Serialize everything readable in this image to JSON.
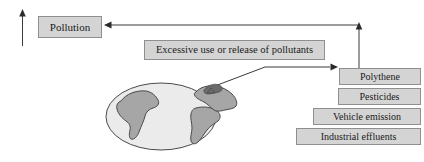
{
  "diagram": {
    "nodes": {
      "pollution": {
        "label": "Pollution"
      },
      "excessive": {
        "label": "Excessive use or release of pollutants"
      },
      "sources": [
        {
          "label": "Polythene"
        },
        {
          "label": "Pesticides"
        },
        {
          "label": "Vehicle emission"
        },
        {
          "label": "Industrial effluents"
        }
      ]
    },
    "illustration": {
      "name": "earth-globe"
    },
    "connectors": [
      {
        "name": "up-arrow-left",
        "direction": "up"
      },
      {
        "name": "sources-to-pollution-arrow",
        "direction": "left"
      },
      {
        "name": "sources-up-arrow",
        "direction": "up"
      },
      {
        "name": "globe-to-sources-arrow",
        "direction": "right"
      }
    ],
    "colors": {
      "box_fill": "#d4d4d4",
      "box_border": "#8f8f8f",
      "stroke": "#3a3a3a",
      "globe_ocean": "#ebebeb",
      "globe_land": "#a6a6a6",
      "background": "#ffffff"
    }
  }
}
